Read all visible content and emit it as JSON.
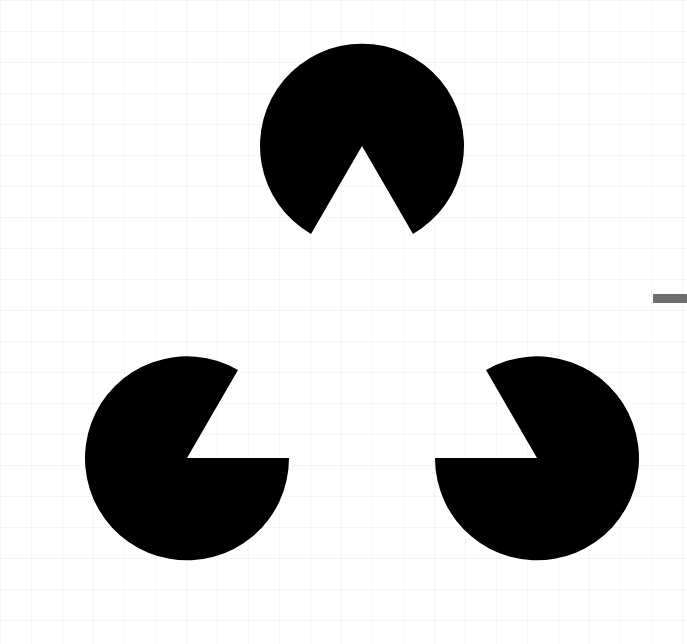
{
  "figure": {
    "title": "",
    "description_shown": "",
    "colors": {
      "background": "#ffffff",
      "shape_fill": "#000000",
      "bar": "#6e6e6e"
    },
    "shapes": [
      {
        "id": "top",
        "cx": 362,
        "cy": 146,
        "r": 102,
        "notch_deg": [
          240,
          300
        ]
      },
      {
        "id": "bottom-left",
        "cx": 187,
        "cy": 458,
        "r": 102,
        "notch_deg": [
          300,
          360
        ]
      },
      {
        "id": "bottom-right",
        "cx": 537,
        "cy": 458,
        "r": 102,
        "notch_deg": [
          180,
          240
        ]
      }
    ]
  }
}
